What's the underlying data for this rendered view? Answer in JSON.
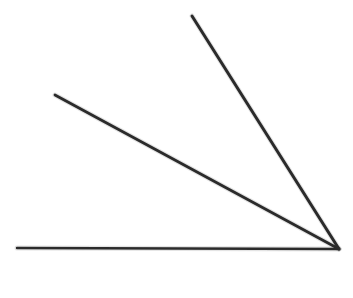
{
  "figure": {
    "kind": "geometry-angle-diagram",
    "canvas": {
      "width": 353,
      "height": 298,
      "background": "#ffffff"
    },
    "style": {
      "stroke_color": "#2b2b2b",
      "stroke_width": 2.6,
      "halo_color": "#555555",
      "halo_width": 5
    },
    "vertex": {
      "x": 339,
      "y": 249,
      "label": ""
    },
    "lines": [
      {
        "name": "baseline",
        "semantic": "horizontal-baseline",
        "x1": 17,
        "y1": 248,
        "x2": 339,
        "y2": 249,
        "angle_deg_from_horizontal": 0,
        "stroke_width": 2.4
      },
      {
        "name": "middle-ray",
        "semantic": "lower-ray",
        "x1": 55,
        "y1": 95,
        "x2": 339,
        "y2": 249,
        "angle_deg_from_horizontal": 28.5,
        "stroke_width": 2.8
      },
      {
        "name": "steep-ray",
        "semantic": "upper-ray",
        "x1": 192,
        "y1": 16,
        "x2": 339,
        "y2": 249,
        "angle_deg_from_horizontal": 57.8,
        "stroke_width": 3.0
      }
    ],
    "angles": [
      {
        "name": "lower-angle",
        "between": [
          "baseline",
          "middle-ray"
        ],
        "measure_deg": 28.5
      },
      {
        "name": "upper-angle",
        "between": [
          "middle-ray",
          "steep-ray"
        ],
        "measure_deg": 29.3
      },
      {
        "name": "total-angle",
        "between": [
          "baseline",
          "steep-ray"
        ],
        "measure_deg": 57.8
      }
    ],
    "labels": []
  }
}
